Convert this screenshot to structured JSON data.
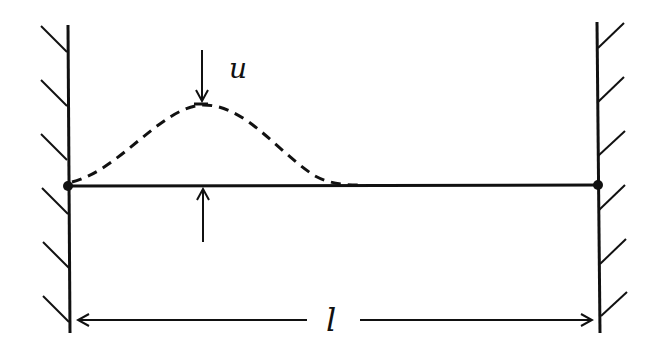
{
  "diagram": {
    "labels": {
      "displacement": "u",
      "length": "l"
    },
    "elements": {
      "left_wall": "fixed wall (hatched)",
      "right_wall": "fixed wall (hatched)",
      "string": "taut string at equilibrium",
      "pulse": "dashed displacement pulse",
      "amplitude_arrows": "arrows marking displacement u",
      "length_dimension": "dimension arrow marking length l"
    },
    "colors": {
      "ink": "#111111",
      "background": "#ffffff"
    }
  }
}
